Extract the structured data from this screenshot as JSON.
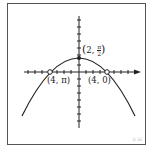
{
  "figure": {
    "labels": {
      "vertex": "(2, π/2)",
      "vertex_x": "2",
      "vertex_y_num": "π",
      "vertex_y_den": "2",
      "left_point": "(4, π)",
      "right_point": "(4, 0)",
      "corner_mark": "ⅱ ⅲ"
    },
    "points": [
      {
        "name": "vertex",
        "label": "(2, π/2)",
        "filled": true
      },
      {
        "name": "left",
        "label": "(4, π)",
        "filled": false
      },
      {
        "name": "right",
        "label": "(4, 0)",
        "filled": false
      }
    ],
    "colors": {
      "stroke": "#222222",
      "frame": "#555555"
    }
  }
}
